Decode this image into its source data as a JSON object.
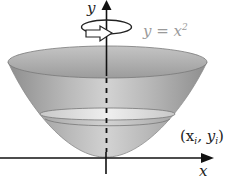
{
  "diagram": {
    "labels": {
      "y_axis": "y",
      "x_axis": "x",
      "curve": "y = x",
      "curve_exponent": "2",
      "point_open": "(x",
      "point_sub_i1": "i",
      "point_mid": ", y",
      "point_sub_i2": "i",
      "point_close": ")"
    },
    "colors": {
      "axis": "#111111",
      "bowl_light": "#d9d9d9",
      "bowl_mid": "#b0b0b0",
      "bowl_dark": "#8a8a8a",
      "rim": "#7a7a7a",
      "slice": "#e6e6e6",
      "curve_label": "#9a9a9a",
      "text": "#222222"
    },
    "elements": [
      "y-axis",
      "x-axis",
      "rotation-arrow",
      "paraboloid-bowl",
      "disk-slice"
    ]
  }
}
